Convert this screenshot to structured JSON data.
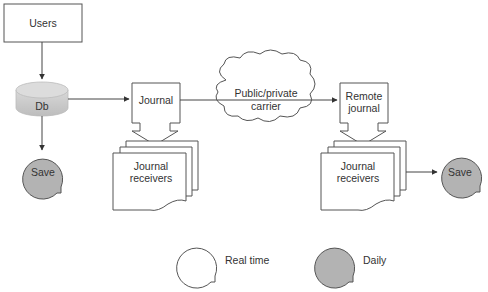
{
  "diagram": {
    "nodes": {
      "users": {
        "label": "Users"
      },
      "db": {
        "label": "Db"
      },
      "save_local": {
        "label": "Save"
      },
      "journal": {
        "label": "Journal"
      },
      "journal_receivers_local": {
        "line1": "Journal",
        "line2": "receivers"
      },
      "carrier": {
        "line1": "Public/private",
        "line2": "carrier"
      },
      "remote_journal": {
        "line1": "Remote",
        "line2": "journal"
      },
      "journal_receivers_remote": {
        "line1": "Journal",
        "line2": "receivers"
      },
      "save_remote": {
        "label": "Save"
      }
    },
    "edges": [
      {
        "from": "users",
        "to": "db"
      },
      {
        "from": "db",
        "to": "save_local"
      },
      {
        "from": "db",
        "to": "journal"
      },
      {
        "from": "journal",
        "to": "journal_receivers_local"
      },
      {
        "from": "journal",
        "to": "remote_journal",
        "via": "carrier"
      },
      {
        "from": "remote_journal",
        "to": "journal_receivers_remote"
      },
      {
        "from": "journal_receivers_remote",
        "to": "save_remote"
      }
    ],
    "legend": {
      "real_time": {
        "label": "Real time",
        "fill": "#ffffff"
      },
      "daily": {
        "label": "Daily",
        "fill": "#b3b3b3"
      }
    },
    "colors": {
      "stroke": "#555555",
      "daily_fill": "#b3b3b3",
      "db_fill": "#c8c8c8",
      "text": "#333333"
    }
  }
}
